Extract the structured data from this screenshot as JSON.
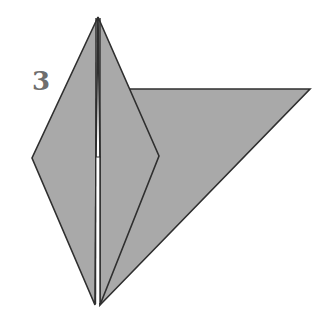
{
  "diagram": {
    "step_label": "3",
    "colors": {
      "paper_fill": "#a9a9a9",
      "outline": "#2f2f2f",
      "slit": "#ffffff",
      "label": "#6e6e6e",
      "background": "#ffffff"
    },
    "shapes": {
      "big_flap_triangle": [
        [
          130,
          89
        ],
        [
          310,
          89
        ],
        [
          100,
          305
        ]
      ],
      "kite_left_half": [
        [
          98,
          17
        ],
        [
          32,
          158
        ],
        [
          95,
          305
        ],
        [
          98,
          157
        ]
      ],
      "kite_right_half": [
        [
          98,
          17
        ],
        [
          159,
          156
        ],
        [
          100,
          305
        ],
        [
          101,
          157
        ]
      ],
      "center_slit": [
        [
          95,
          157
        ],
        [
          101,
          157
        ],
        [
          100,
          305
        ],
        [
          95,
          305
        ]
      ]
    }
  }
}
